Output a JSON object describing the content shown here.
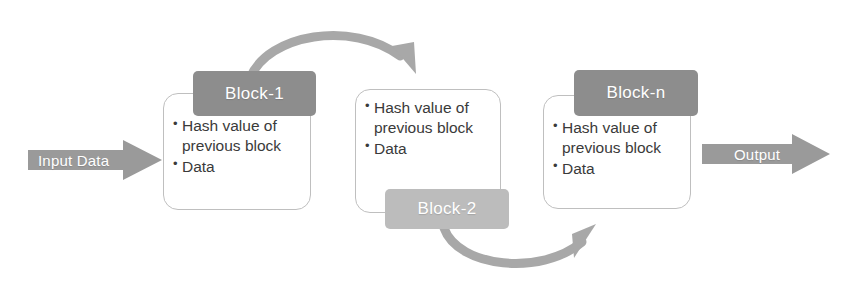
{
  "diagram": {
    "colors": {
      "tab_dark_gray": "#8d8d8d",
      "tab_light_gray": "#bcbcbc",
      "arrow_gray": "#9a9a9a",
      "curve_gray": "#a8a8a8",
      "card_border": "#bfbfbf",
      "card_fill": "#ffffff",
      "body_text": "#3a3a3a",
      "label_text": "#ffffff"
    }
  },
  "input_arrow": {
    "label": "Input Data",
    "icon": "right-arrow-icon"
  },
  "output_arrow": {
    "label": "Output",
    "icon": "right-arrow-icon"
  },
  "blocks": [
    {
      "id": "block-1",
      "label": "Block-1",
      "tab_position": "top",
      "items": [
        "Hash value of previous block",
        "Data"
      ]
    },
    {
      "id": "block-2",
      "label": "Block-2",
      "tab_position": "bottom",
      "items": [
        "Hash value of previous block",
        "Data"
      ]
    },
    {
      "id": "block-n",
      "label": "Block-n",
      "tab_position": "top",
      "items": [
        "Hash value of previous block",
        "Data"
      ]
    }
  ],
  "connectors": [
    {
      "id": "curve-top",
      "icon": "curved-arrow-icon",
      "from": "block-1",
      "to": "block-2",
      "direction": "arc-over"
    },
    {
      "id": "curve-bottom",
      "icon": "curved-arrow-icon",
      "from": "block-2",
      "to": "block-n",
      "direction": "arc-under"
    }
  ]
}
